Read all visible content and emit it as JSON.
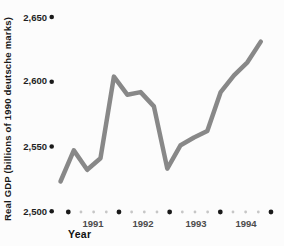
{
  "chart_data": {
    "type": "line",
    "title": "",
    "ylabel": "Real GDP (billions of 1990 deutsche marks)",
    "xlabel": "Year",
    "x_unit": "quarter",
    "categories": [
      "1991 Q1",
      "1991 Q2",
      "1991 Q3",
      "1991 Q4",
      "1992 Q1",
      "1992 Q2",
      "1992 Q3",
      "1992 Q4",
      "1993 Q1",
      "1993 Q2",
      "1993 Q3",
      "1993 Q4",
      "1994 Q1",
      "1994 Q2",
      "1994 Q3",
      "1994 Q4"
    ],
    "values": [
      2523,
      2547,
      2532,
      2541,
      2604,
      2590,
      2592,
      2581,
      2533,
      2551,
      2557,
      2562,
      2592,
      2605,
      2615,
      2631
    ],
    "ylim": [
      2500,
      2650
    ],
    "yticks": [
      {
        "label": "2,650",
        "value": 2650
      },
      {
        "label": "2,600",
        "value": 2600
      },
      {
        "label": "2,550",
        "value": 2550
      },
      {
        "label": "2,500",
        "value": 2500
      }
    ],
    "year_labels": [
      "1991",
      "1992",
      "1993",
      "1994"
    ],
    "grid": false,
    "legend": "none",
    "colors": {
      "line": "#888888",
      "big_dot": "#1a1a1a",
      "small_dot": "#c6c6c6",
      "background": "#fcfcfc"
    }
  }
}
